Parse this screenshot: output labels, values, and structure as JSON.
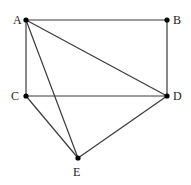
{
  "diagram": {
    "type": "graph",
    "points": [
      {
        "id": "A",
        "label": "A",
        "x": 26,
        "y": 20,
        "lx": 13,
        "ly": 24
      },
      {
        "id": "B",
        "label": "B",
        "x": 167,
        "y": 20,
        "lx": 173,
        "ly": 24
      },
      {
        "id": "C",
        "label": "C",
        "x": 26,
        "y": 96,
        "lx": 11,
        "ly": 100
      },
      {
        "id": "D",
        "label": "D",
        "x": 167,
        "y": 96,
        "lx": 173,
        "ly": 100
      },
      {
        "id": "E",
        "label": "E",
        "x": 78,
        "y": 158,
        "lx": 73,
        "ly": 176
      }
    ],
    "edges": [
      [
        "A",
        "B"
      ],
      [
        "A",
        "C"
      ],
      [
        "A",
        "D"
      ],
      [
        "A",
        "E"
      ],
      [
        "B",
        "D"
      ],
      [
        "C",
        "D"
      ],
      [
        "C",
        "E"
      ],
      [
        "D",
        "E"
      ]
    ]
  }
}
